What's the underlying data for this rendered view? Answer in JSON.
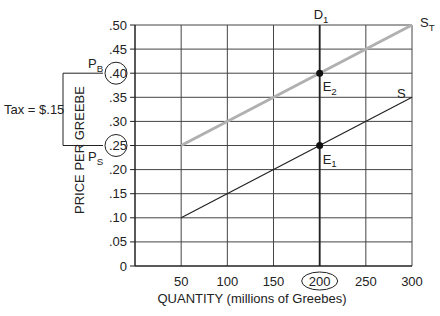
{
  "chart_data": {
    "type": "line",
    "title": "",
    "xlabel": "QUANTITY (millions of Greebes)",
    "ylabel": "PRICE PER GREEBE",
    "xlim": [
      0,
      300
    ],
    "ylim": [
      0,
      0.5
    ],
    "grid": true,
    "x_ticks": [
      "50",
      "100",
      "150",
      "200",
      "250",
      "300"
    ],
    "x_tick_values": [
      50,
      100,
      150,
      200,
      250,
      300
    ],
    "y_ticks": [
      "0",
      ".05",
      ".10",
      ".15",
      ".20",
      ".25",
      ".30",
      ".35",
      ".40",
      ".45",
      ".50"
    ],
    "y_tick_values": [
      0,
      0.05,
      0.1,
      0.15,
      0.2,
      0.25,
      0.3,
      0.35,
      0.4,
      0.45,
      0.5
    ],
    "series": [
      {
        "name": "S",
        "label": "S",
        "color": "#222222",
        "x": [
          50,
          300
        ],
        "y": [
          0.1,
          0.35
        ]
      },
      {
        "name": "S_T",
        "label": "S",
        "label_sub": "T",
        "color": "#b0b0b0",
        "x": [
          50,
          300
        ],
        "y": [
          0.25,
          0.5
        ]
      },
      {
        "name": "D_1",
        "label": "D",
        "label_sub": "1",
        "color": "#222222",
        "x": [
          200,
          200
        ],
        "y": [
          0,
          0.5
        ]
      }
    ],
    "points": [
      {
        "name": "E1",
        "label": "E",
        "label_sub": "1",
        "x": 200,
        "y": 0.25
      },
      {
        "name": "E2",
        "label": "E",
        "label_sub": "2",
        "x": 200,
        "y": 0.4
      }
    ],
    "annotations": {
      "circled_y_ticks": [
        ".40",
        ".25"
      ],
      "circled_x_ticks": [
        "200"
      ],
      "pb_label": "P",
      "pb_sub": "B",
      "ps_label": "P",
      "ps_sub": "S",
      "tax_label": "Tax = $.15"
    }
  }
}
